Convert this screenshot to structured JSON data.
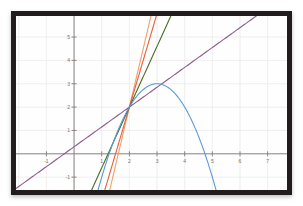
{
  "figure": {
    "title": "",
    "frame_color": "#201d1c",
    "background_color": "#ffffff",
    "grid_color": "#eceaea",
    "axis_color": "#8b8685"
  },
  "chart_data": {
    "type": "line",
    "title": "",
    "xlabel": "",
    "ylabel": "",
    "xlim": [
      -2.1,
      7.7
    ],
    "ylim": [
      -1.55,
      5.9
    ],
    "grid": true,
    "legend": "none",
    "xticks": [
      -1,
      1,
      2,
      3,
      4,
      5,
      6,
      7
    ],
    "xtick_labels": [
      "-1",
      "1",
      "2",
      "3",
      "4",
      "5",
      "6",
      "7"
    ],
    "yticks": [
      -1,
      1,
      2,
      3,
      4,
      5
    ],
    "ytick_labels": [
      "-1",
      "1",
      "2",
      "3",
      "4",
      "5"
    ],
    "common_point": [
      2,
      2
    ],
    "series": [
      {
        "name": "parabola",
        "color": "#5b9bd5",
        "kind": "quadratic",
        "equation": "y = -(x-3)^2 + 3",
        "vertex": [
          3,
          3
        ],
        "x_intercepts": [
          1.27,
          4.73
        ],
        "x_range": [
          0.85,
          5.35
        ]
      },
      {
        "name": "secant-orange-light",
        "color": "#f0a06a",
        "kind": "line",
        "slope": 5.0,
        "y_intercept": -8.0,
        "through": [
          2,
          2
        ]
      },
      {
        "name": "secant-red-orange",
        "color": "#e2603c",
        "kind": "line",
        "slope": 4.0,
        "y_intercept": -6.0,
        "through": [
          2,
          2
        ]
      },
      {
        "name": "secant-green",
        "color": "#4a6b27",
        "kind": "line",
        "slope": 2.6,
        "y_intercept": -3.2,
        "through": [
          2,
          2
        ]
      },
      {
        "name": "tangent-purple",
        "color": "#8d5b8a",
        "kind": "line",
        "slope": 0.85,
        "y_intercept": 0.3,
        "through": [
          2,
          2
        ]
      }
    ]
  }
}
